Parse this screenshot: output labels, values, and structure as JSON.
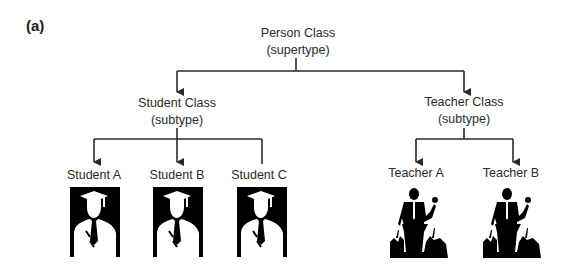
{
  "figure": {
    "panel_label": "(a)",
    "root": {
      "title": "Person Class",
      "role": "(supertype)"
    },
    "subclasses": [
      {
        "title": "Student Class",
        "role": "(subtype)",
        "instances": [
          {
            "label": "Student A",
            "icon": "graduate-silhouette-icon"
          },
          {
            "label": "Student B",
            "icon": "graduate-silhouette-icon"
          },
          {
            "label": "Student C",
            "icon": "graduate-silhouette-icon"
          }
        ]
      },
      {
        "title": "Teacher Class",
        "role": "(subtype)",
        "instances": [
          {
            "label": "Teacher A",
            "icon": "lecturer-podium-silhouette-icon"
          },
          {
            "label": "Teacher B",
            "icon": "lecturer-podium-silhouette-icon"
          }
        ]
      }
    ],
    "colors": {
      "line": "#2a2a2a",
      "silhouette": "#000000",
      "background": "#ffffff"
    }
  }
}
